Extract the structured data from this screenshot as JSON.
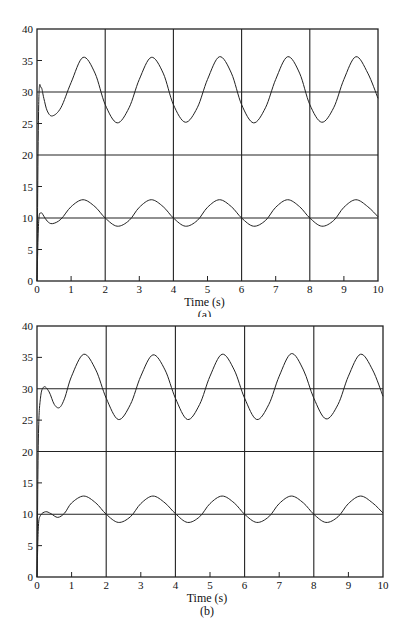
{
  "chart_data": [
    {
      "type": "line",
      "panel_label": "(a)",
      "title": "",
      "xlabel": "Time (s)",
      "ylabel": "",
      "xlim": [
        0,
        10
      ],
      "ylim": [
        0,
        40
      ],
      "xticks": [
        0,
        1,
        2,
        3,
        4,
        5,
        6,
        7,
        8,
        9,
        10
      ],
      "yticks": [
        0,
        5,
        10,
        15,
        20,
        25,
        30,
        35,
        40
      ],
      "grid": {
        "x": [
          2,
          4,
          6,
          8
        ],
        "y": [
          10,
          20,
          30
        ]
      },
      "legend": null,
      "series": [
        {
          "name": "upper response",
          "x": [
            0,
            0.05,
            0.12,
            0.2,
            0.3,
            0.45,
            0.7,
            1.0,
            1.35,
            1.7,
            2.0,
            2.35,
            2.7,
            3.0,
            3.35,
            3.7,
            4.0,
            4.35,
            4.7,
            5.0,
            5.35,
            5.7,
            6.0,
            6.35,
            6.7,
            7.0,
            7.35,
            7.7,
            8.0,
            8.35,
            8.7,
            9.0,
            9.35,
            9.7,
            10.0
          ],
          "y": [
            0,
            28,
            30.7,
            29,
            27,
            26.2,
            27.5,
            31.5,
            35.5,
            33,
            28,
            25.1,
            27.5,
            32,
            35.5,
            33,
            28,
            25.2,
            27.5,
            32,
            35.6,
            33,
            28,
            25.1,
            27.5,
            32,
            35.6,
            33,
            28,
            25.2,
            27.5,
            32,
            35.6,
            33,
            29
          ]
        },
        {
          "name": "lower response",
          "x": [
            0,
            0.05,
            0.12,
            0.2,
            0.3,
            0.45,
            0.7,
            1.0,
            1.35,
            1.7,
            2.0,
            2.35,
            2.7,
            3.0,
            3.35,
            3.7,
            4.0,
            4.35,
            4.7,
            5.0,
            5.35,
            5.7,
            6.0,
            6.35,
            6.7,
            7.0,
            7.35,
            7.7,
            8.0,
            8.35,
            8.7,
            9.0,
            9.35,
            9.7,
            10.0
          ],
          "y": [
            0,
            9.5,
            10.8,
            10.3,
            9.5,
            9.1,
            9.8,
            11.8,
            12.9,
            11.8,
            10,
            8.7,
            9.6,
            11.7,
            12.9,
            11.8,
            10,
            8.7,
            9.6,
            11.7,
            12.9,
            11.8,
            10,
            8.7,
            9.6,
            11.7,
            12.9,
            11.8,
            10,
            8.7,
            9.6,
            11.7,
            12.9,
            11.8,
            10.2
          ]
        }
      ]
    },
    {
      "type": "line",
      "panel_label": "(b)",
      "title": "",
      "xlabel": "Time (s)",
      "ylabel": "",
      "xlim": [
        0,
        10
      ],
      "ylim": [
        0,
        40
      ],
      "xticks": [
        0,
        1,
        2,
        3,
        4,
        5,
        6,
        7,
        8,
        9,
        10
      ],
      "yticks": [
        0,
        5,
        10,
        15,
        20,
        25,
        30,
        35,
        40
      ],
      "grid": {
        "x": [
          2,
          4,
          6,
          8
        ],
        "y": [
          10,
          20,
          30
        ]
      },
      "legend": null,
      "series": [
        {
          "name": "upper response",
          "x": [
            0,
            0.04,
            0.1,
            0.2,
            0.35,
            0.5,
            0.65,
            0.8,
            1.0,
            1.35,
            1.7,
            2.0,
            2.35,
            2.7,
            3.0,
            3.35,
            3.7,
            4.0,
            4.35,
            4.7,
            5.0,
            5.35,
            5.7,
            6.0,
            6.35,
            6.7,
            7.0,
            7.35,
            7.7,
            8.0,
            8.35,
            8.7,
            9.0,
            9.35,
            9.7,
            10.0
          ],
          "y": [
            0,
            22,
            28.5,
            30.3,
            29.5,
            27.5,
            27,
            28.5,
            32,
            35.5,
            33,
            28.5,
            25.1,
            27.5,
            32,
            35.4,
            33,
            28.5,
            25.1,
            27.5,
            32,
            35.5,
            33,
            28.5,
            25.1,
            27.5,
            32,
            35.6,
            33,
            28.5,
            25.2,
            27.5,
            32,
            35.5,
            33,
            28.8
          ]
        },
        {
          "name": "lower response",
          "x": [
            0,
            0.04,
            0.1,
            0.25,
            0.4,
            0.6,
            0.8,
            1.0,
            1.35,
            1.7,
            2.0,
            2.35,
            2.7,
            3.0,
            3.35,
            3.7,
            4.0,
            4.35,
            4.7,
            5.0,
            5.35,
            5.7,
            6.0,
            6.35,
            6.7,
            7.0,
            7.35,
            7.7,
            8.0,
            8.35,
            8.7,
            9.0,
            9.35,
            9.7,
            10.0
          ],
          "y": [
            0,
            8,
            9.8,
            10.4,
            10.1,
            9.5,
            10.2,
            11.8,
            12.9,
            11.8,
            10,
            8.7,
            9.6,
            11.7,
            12.9,
            11.8,
            10.1,
            8.7,
            9.6,
            11.7,
            12.9,
            11.8,
            10,
            8.7,
            9.6,
            11.7,
            12.9,
            11.8,
            10,
            8.7,
            9.6,
            11.7,
            12.9,
            11.8,
            10.2
          ]
        }
      ]
    }
  ],
  "figure": {
    "panels": [
      {
        "xlabel": "Time (s)",
        "label": "(a)"
      },
      {
        "xlabel": "Time (s)",
        "label": "(b)"
      }
    ]
  }
}
